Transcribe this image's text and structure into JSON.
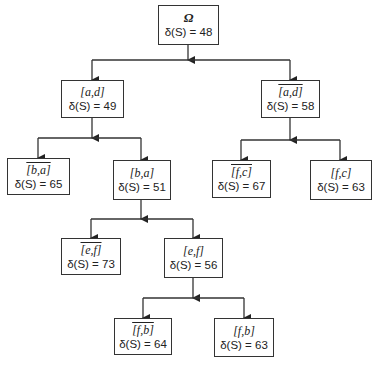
{
  "diagram": {
    "type": "tree",
    "nodes": [
      {
        "id": "root",
        "label": "Ω",
        "complement": false,
        "value_text": "δ(S) = 48",
        "value": 48
      },
      {
        "id": "ad",
        "label": "[a,d]",
        "complement": false,
        "value_text": "δ(S) = 49",
        "value": 49
      },
      {
        "id": "ad_bar",
        "label": "[a,d]",
        "complement": true,
        "value_text": "δ(S) = 58",
        "value": 58
      },
      {
        "id": "ba_bar",
        "label": "[b,a]",
        "complement": true,
        "value_text": "δ(S) = 65",
        "value": 65
      },
      {
        "id": "ba",
        "label": "[b,a]",
        "complement": false,
        "value_text": "δ(S) = 51",
        "value": 51
      },
      {
        "id": "fc_bar",
        "label": "[f,c]",
        "complement": true,
        "value_text": "δ(S) = 67",
        "value": 67
      },
      {
        "id": "fc",
        "label": "[f,c]",
        "complement": false,
        "value_text": "δ(S) = 63",
        "value": 63
      },
      {
        "id": "ef_bar",
        "label": "[e,f]",
        "complement": true,
        "value_text": "δ(S) = 73",
        "value": 73
      },
      {
        "id": "ef",
        "label": "[e,f]",
        "complement": false,
        "value_text": "δ(S) = 56",
        "value": 56
      },
      {
        "id": "fb_bar",
        "label": "[f,b]",
        "complement": true,
        "value_text": "δ(S) = 64",
        "value": 64
      },
      {
        "id": "fb",
        "label": "[f,b]",
        "complement": false,
        "value_text": "δ(S) = 63",
        "value": 63
      }
    ],
    "edges": [
      [
        "root",
        "ad"
      ],
      [
        "root",
        "ad_bar"
      ],
      [
        "ad",
        "ba_bar"
      ],
      [
        "ad",
        "ba"
      ],
      [
        "ad_bar",
        "fc_bar"
      ],
      [
        "ad_bar",
        "fc"
      ],
      [
        "ba",
        "ef_bar"
      ],
      [
        "ba",
        "ef"
      ],
      [
        "ef",
        "fb_bar"
      ],
      [
        "ef",
        "fb"
      ]
    ]
  }
}
